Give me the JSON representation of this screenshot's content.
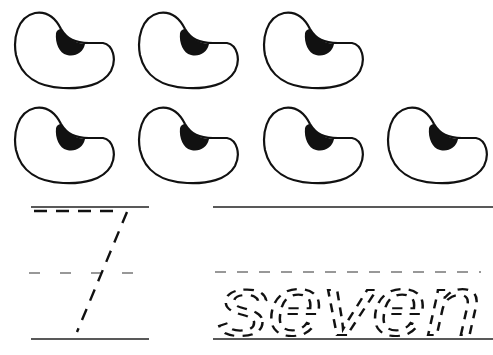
{
  "worksheet": {
    "number": "7",
    "word": "seven",
    "count": 7,
    "object": "bean",
    "rows": [
      {
        "beans": [
          {
            "x": 13,
            "y": 11
          },
          {
            "x": 137,
            "y": 11
          },
          {
            "x": 262,
            "y": 11
          }
        ]
      },
      {
        "beans": [
          {
            "x": 13,
            "y": 106
          },
          {
            "x": 137,
            "y": 106
          },
          {
            "x": 262,
            "y": 106
          },
          {
            "x": 386,
            "y": 106
          }
        ]
      }
    ],
    "colors": {
      "ink": "#111111",
      "background": "#ffffff"
    }
  }
}
